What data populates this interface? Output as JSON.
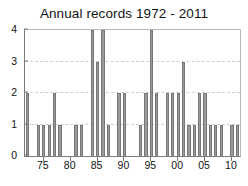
{
  "chart_data": {
    "type": "bar",
    "title": "Annual records 1972 - 2011",
    "xlabel": "",
    "ylabel": "",
    "ylim": [
      0,
      4
    ],
    "yticks": [
      0,
      1,
      2,
      3,
      4
    ],
    "ytick_labels": [
      "0",
      "1",
      "2",
      "3",
      "4"
    ],
    "xlim": [
      1971.5,
      2011.5
    ],
    "xticks": [
      1975,
      1980,
      1985,
      1990,
      1995,
      2000,
      2005,
      2010
    ],
    "xtick_labels": [
      "75",
      "80",
      "85",
      "90",
      "95",
      "00",
      "05",
      "10"
    ],
    "grid": true,
    "grid_axis": "y",
    "legend": false,
    "bar_color": "#9a9a9a",
    "bar_edge_color": "#777777",
    "categories": [
      1972,
      1973,
      1974,
      1975,
      1976,
      1977,
      1978,
      1979,
      1980,
      1981,
      1982,
      1983,
      1984,
      1985,
      1986,
      1987,
      1988,
      1989,
      1990,
      1991,
      1992,
      1993,
      1994,
      1995,
      1996,
      1997,
      1998,
      1999,
      2000,
      2001,
      2002,
      2003,
      2004,
      2005,
      2006,
      2007,
      2008,
      2009,
      2010,
      2011
    ],
    "values": [
      2,
      0,
      1,
      1,
      1,
      2,
      1,
      0,
      0,
      1,
      1,
      0,
      4,
      3,
      4,
      1,
      0,
      2,
      2,
      0,
      0,
      1,
      2,
      4,
      2,
      0,
      2,
      2,
      2,
      3,
      1,
      1,
      2,
      2,
      1,
      1,
      1,
      0,
      1,
      1
    ]
  }
}
